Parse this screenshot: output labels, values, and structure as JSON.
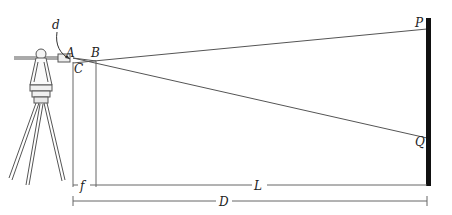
{
  "diagram": {
    "labels": {
      "d": "d",
      "A": "A",
      "B": "B",
      "C": "C",
      "P": "P",
      "Q": "Q",
      "f": "f",
      "L": "L",
      "D": "D"
    },
    "colors": {
      "line": "#555555",
      "rod": "#111111",
      "background": "#ffffff"
    }
  }
}
